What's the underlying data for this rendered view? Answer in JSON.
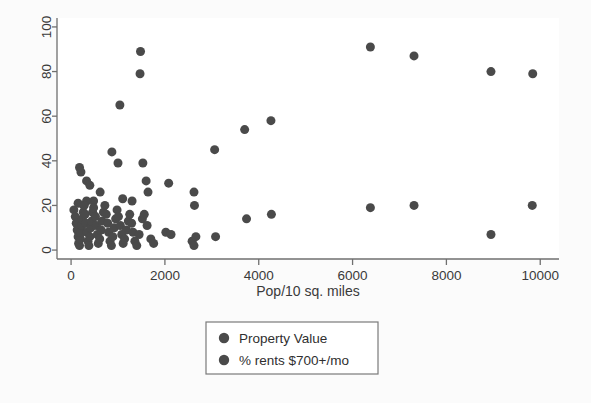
{
  "figure": {
    "background_color": "#fbfbfb",
    "plot_background_color": "#ffffff",
    "marker_color": "#4a4a4a",
    "axis_color": "#6f6f6f",
    "text_color": "#3a3a3a"
  },
  "chart_data": {
    "type": "scatter",
    "title": "",
    "subtitle": "",
    "xlabel": "Pop/10 sq. miles",
    "ylabel": "",
    "xlim": [
      -300,
      10400
    ],
    "ylim": [
      -4,
      104
    ],
    "xticks": [
      0,
      2000,
      4000,
      6000,
      8000,
      10000
    ],
    "yticks": [
      0,
      20,
      40,
      60,
      80,
      100
    ],
    "xticklabels": [
      "0",
      "2000",
      "4000",
      "6000",
      "8000",
      "10000"
    ],
    "yticklabels": [
      "0",
      "20",
      "40",
      "60",
      "80",
      "100"
    ],
    "grid": false,
    "legend_position": "below-axes-center",
    "legend": [
      "Property Value",
      "% rents $700+/mo"
    ],
    "marker_size": 9,
    "series": [
      {
        "name": "Property Value",
        "color": "#4a4a4a",
        "points": [
          [
            1480,
            89
          ],
          [
            1470,
            79
          ],
          [
            1040,
            65
          ],
          [
            3700,
            54
          ],
          [
            4260,
            58
          ],
          [
            3060,
            45
          ],
          [
            6380,
            91
          ],
          [
            7310,
            87
          ],
          [
            8950,
            80
          ],
          [
            9840,
            79
          ],
          [
            180,
            37
          ],
          [
            210,
            35
          ],
          [
            870,
            44
          ],
          [
            1000,
            39
          ],
          [
            1530,
            39
          ],
          [
            330,
            31
          ],
          [
            400,
            29
          ],
          [
            1600,
            31
          ],
          [
            1640,
            26
          ],
          [
            2080,
            30
          ],
          [
            620,
            26
          ],
          [
            480,
            22
          ],
          [
            2620,
            26
          ],
          [
            1100,
            23
          ],
          [
            1300,
            22
          ],
          [
            150,
            21
          ],
          [
            270,
            20
          ],
          [
            330,
            22
          ],
          [
            2630,
            20
          ],
          [
            3740,
            14
          ],
          [
            4270,
            16
          ],
          [
            6380,
            19
          ],
          [
            7310,
            20
          ],
          [
            9830,
            20
          ]
        ]
      },
      {
        "name": "% rents $700+/mo",
        "color": "#4a4a4a",
        "points": [
          [
            60,
            18
          ],
          [
            90,
            15
          ],
          [
            110,
            12
          ],
          [
            130,
            9
          ],
          [
            150,
            6
          ],
          [
            160,
            3
          ],
          [
            180,
            2
          ],
          [
            200,
            5
          ],
          [
            210,
            8
          ],
          [
            230,
            11
          ],
          [
            240,
            14
          ],
          [
            260,
            17
          ],
          [
            280,
            20
          ],
          [
            300,
            16
          ],
          [
            320,
            12
          ],
          [
            340,
            8
          ],
          [
            360,
            4
          ],
          [
            380,
            2
          ],
          [
            400,
            6
          ],
          [
            420,
            10
          ],
          [
            440,
            13
          ],
          [
            460,
            17
          ],
          [
            480,
            19
          ],
          [
            520,
            15
          ],
          [
            540,
            11
          ],
          [
            560,
            7
          ],
          [
            580,
            3
          ],
          [
            610,
            5
          ],
          [
            640,
            9
          ],
          [
            660,
            13
          ],
          [
            690,
            17
          ],
          [
            720,
            20
          ],
          [
            750,
            16
          ],
          [
            780,
            12
          ],
          [
            800,
            8
          ],
          [
            830,
            4
          ],
          [
            860,
            2
          ],
          [
            890,
            6
          ],
          [
            920,
            10
          ],
          [
            950,
            14
          ],
          [
            980,
            18
          ],
          [
            1010,
            15
          ],
          [
            1050,
            11
          ],
          [
            1080,
            7
          ],
          [
            1110,
            3
          ],
          [
            1140,
            5
          ],
          [
            1180,
            9
          ],
          [
            1220,
            13
          ],
          [
            1250,
            16
          ],
          [
            1290,
            12
          ],
          [
            1320,
            8
          ],
          [
            1360,
            4
          ],
          [
            1400,
            2
          ],
          [
            1450,
            7
          ],
          [
            1520,
            14
          ],
          [
            1560,
            16
          ],
          [
            1620,
            11
          ],
          [
            1700,
            5
          ],
          [
            1760,
            3
          ],
          [
            2020,
            8
          ],
          [
            2130,
            7
          ],
          [
            2580,
            4
          ],
          [
            2620,
            2
          ],
          [
            2660,
            6
          ],
          [
            3080,
            6
          ],
          [
            8950,
            7
          ]
        ]
      }
    ]
  },
  "axis_titles": {
    "x": "Pop/10 sq. miles"
  },
  "legend_items": [
    {
      "label": "Property Value",
      "marker": "circle-marker"
    },
    {
      "label": "% rents $700+/mo",
      "marker": "circle-marker"
    }
  ]
}
